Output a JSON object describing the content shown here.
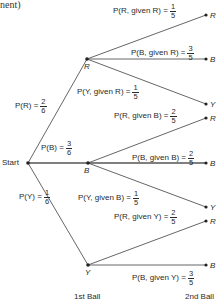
{
  "header": {
    "text": "nent)"
  },
  "root": {
    "label": "Start"
  },
  "first_level": [
    {
      "node": "R",
      "prob_label": "P(R) = ",
      "num": "2",
      "den": "6"
    },
    {
      "node": "B",
      "prob_label": "P(B) = ",
      "num": "3",
      "den": "6"
    },
    {
      "node": "Y",
      "prob_label": "P(Y) = ",
      "num": "1",
      "den": "6"
    }
  ],
  "second_level": [
    {
      "node": "R",
      "label": "P(R, given R) = ",
      "num": "1",
      "den": "5"
    },
    {
      "node": "B",
      "label": "P(B, given R) = ",
      "num": "3",
      "den": "5"
    },
    {
      "node": "Y",
      "label": "P(Y, given R) = ",
      "num": "1",
      "den": "5"
    },
    {
      "node": "R",
      "label": "P(R, given B) = ",
      "num": "2",
      "den": "5"
    },
    {
      "node": "B",
      "label": "P(B, given B) = ",
      "num": "2",
      "den": "5"
    },
    {
      "node": "Y",
      "label": "P(Y, given B) = ",
      "num": "1",
      "den": "5"
    },
    {
      "node": "R",
      "label": "P(R, given Y) = ",
      "num": "2",
      "den": "5"
    },
    {
      "node": "B",
      "label": "P(B, given Y) = ",
      "num": "3",
      "den": "5"
    }
  ],
  "footer": {
    "first": "1st Ball",
    "second": "2nd Ball"
  },
  "colors": {
    "line": "#555555",
    "text": "#2a2a2a"
  }
}
